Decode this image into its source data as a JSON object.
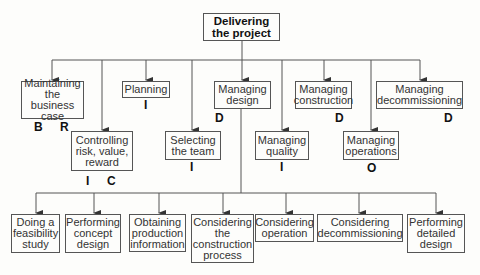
{
  "root": {
    "label": "Delivering the project"
  },
  "level1": [
    {
      "label": "Maintaining the business case",
      "tags": [
        "B",
        "R"
      ]
    },
    {
      "label": "Controlling risk, value, reward",
      "tags": [
        "I",
        "C"
      ]
    },
    {
      "label": "Planning",
      "tags": [
        "I"
      ]
    },
    {
      "label": "Selecting the team",
      "tags": [
        "I"
      ]
    },
    {
      "label": "Managing design",
      "tags": [
        "D"
      ]
    },
    {
      "label": "Managing quality",
      "tags": [
        "I"
      ]
    },
    {
      "label": "Managing construction",
      "tags": [
        "D"
      ]
    },
    {
      "label": "Managing operations",
      "tags": [
        "O"
      ]
    },
    {
      "label": "Managing decommissioning",
      "tags": [
        "D"
      ]
    }
  ],
  "design_children": [
    {
      "label": "Doing a feasibility study"
    },
    {
      "label": "Performing concept design"
    },
    {
      "label": "Obtaining production information"
    },
    {
      "label": "Considering the construction process"
    },
    {
      "label": "Considering operation"
    },
    {
      "label": "Considering decommissioning"
    },
    {
      "label": "Performing detailed design"
    }
  ],
  "colors": {
    "line": "#555555",
    "text": "#222222",
    "background": "#fdfdfb"
  }
}
